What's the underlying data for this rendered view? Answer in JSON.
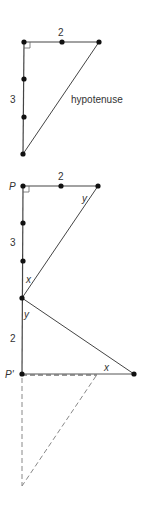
{
  "diagram": {
    "colors": {
      "line": "#444444",
      "dot": "#111111",
      "dashed": "#888888",
      "text": "#333333"
    },
    "top_triangle": {
      "labels": {
        "top_side": "2",
        "left_side": "3",
        "hypotenuse": "hypotenuse"
      }
    },
    "bottom_figure": {
      "labels": {
        "vertex_p": "P",
        "vertex_p_prime": "P'",
        "top_side": "2",
        "left_side": "3",
        "lower_left_side": "2",
        "angle_y_top": "y",
        "angle_x_mid": "x",
        "angle_y_mid": "y",
        "angle_x_bottom": "x"
      }
    }
  }
}
